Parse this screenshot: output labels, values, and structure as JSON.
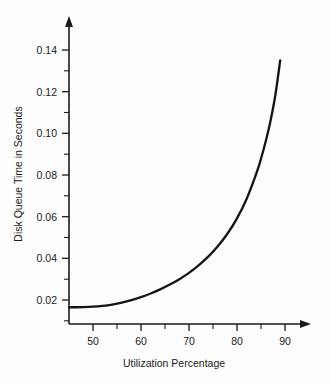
{
  "chart_data": {
    "type": "line",
    "title": "",
    "xlabel": "Utilization Percentage",
    "ylabel": "Disk Queue Time in Seconds",
    "xlim": [
      45,
      92
    ],
    "ylim": [
      0.012,
      0.148
    ],
    "grid": false,
    "legend": "none",
    "x_major_ticks": [
      50,
      60,
      70,
      80,
      90
    ],
    "x_major_tick_labels": [
      "50",
      "60",
      "70",
      "80",
      "90"
    ],
    "x_minor_ticks": [
      45,
      55,
      65,
      75,
      85
    ],
    "y_major_ticks": [
      0.02,
      0.04,
      0.06,
      0.08,
      0.1,
      0.12,
      0.14
    ],
    "y_major_tick_labels": [
      "0.02",
      "0.04",
      "0.06",
      "0.08",
      "0.10",
      "0.12",
      "0.14"
    ],
    "y_minor_ticks": [
      0.03,
      0.05,
      0.07,
      0.09,
      0.11,
      0.13
    ],
    "series": [
      {
        "name": "Disk queue time",
        "x": [
          45,
          48,
          50,
          52,
          54,
          56,
          58,
          60,
          62,
          64,
          66,
          68,
          70,
          72,
          74,
          76,
          78,
          80,
          82,
          84,
          85,
          86,
          87,
          88,
          89
        ],
        "values": [
          0.0165,
          0.0166,
          0.0168,
          0.0172,
          0.0178,
          0.0187,
          0.0199,
          0.0214,
          0.0231,
          0.0251,
          0.0274,
          0.03,
          0.033,
          0.0366,
          0.0408,
          0.0458,
          0.0518,
          0.0592,
          0.0685,
          0.0805,
          0.0878,
          0.0963,
          0.1062,
          0.1185,
          0.135
        ]
      }
    ]
  },
  "axes": {
    "x_label": "Utilization Percentage",
    "y_label": "Disk Queue Time in Seconds"
  },
  "colors": {
    "curve": "#141414",
    "axis": "#1a1a1a",
    "background": "#fdfdfd"
  }
}
